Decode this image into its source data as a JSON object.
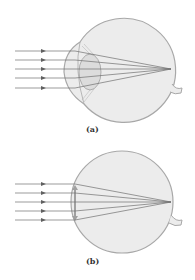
{
  "figures": [
    {
      "id": "a",
      "label": "(a)",
      "description": "Eye with cornea and crystalline lens focusing parallel rays on retina",
      "ray_count": 5
    },
    {
      "id": "b",
      "label": "(b)",
      "description": "Eye without cornea bulge; thin lens focusing parallel rays on retina",
      "ray_count": 5
    }
  ],
  "colors": {
    "eye_fill": "#ececec",
    "eye_stroke": "#a8a8a8",
    "ray": "#707070",
    "lens_fill": "#dcdcdc",
    "lens_stroke": "#a0a0a0",
    "arrow": "#606060"
  }
}
